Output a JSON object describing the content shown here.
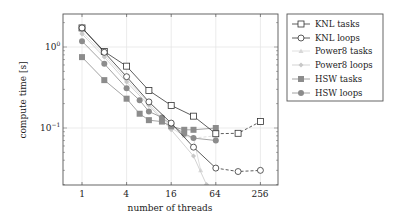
{
  "chart_data": {
    "type": "line",
    "title": "",
    "xlabel": "number of threads",
    "ylabel": "compute time [s]",
    "xscale": "log2",
    "yscale": "log10",
    "xlim": [
      0.56,
      430
    ],
    "ylim": [
      0.02,
      2.55
    ],
    "xticks": [
      1,
      4,
      16,
      64,
      256
    ],
    "xtick_labels": [
      "1",
      "4",
      "16",
      "64",
      "256"
    ],
    "yticks": [
      0.1,
      1
    ],
    "ytick_labels": [
      "10^-1",
      "10^0"
    ],
    "grid": true,
    "legend_position": "outside right, top",
    "series": [
      {
        "name": "KNL tasks",
        "marker": "square-open",
        "color": "#333333",
        "points": [
          [
            1,
            1.72
          ],
          [
            2,
            0.88
          ],
          [
            4,
            0.58
          ],
          [
            8,
            0.29
          ],
          [
            16,
            0.19
          ],
          [
            32,
            0.14
          ],
          [
            64,
            0.085
          ]
        ],
        "dashed_tail": [
          [
            64,
            0.085
          ],
          [
            128,
            0.086
          ],
          [
            256,
            0.12
          ]
        ]
      },
      {
        "name": "KNL loops",
        "marker": "circle-open",
        "color": "#333333",
        "points": [
          [
            1,
            1.72
          ],
          [
            2,
            0.86
          ],
          [
            4,
            0.43
          ],
          [
            8,
            0.21
          ],
          [
            16,
            0.115
          ],
          [
            32,
            0.058
          ],
          [
            64,
            0.032
          ]
        ],
        "dashed_tail": [
          [
            64,
            0.032
          ],
          [
            128,
            0.029
          ],
          [
            256,
            0.03
          ]
        ]
      },
      {
        "name": "Power8 tasks",
        "marker": "triangle",
        "color": "#d8d8d8",
        "points": [
          [
            1,
            1.55
          ],
          [
            2,
            0.8
          ],
          [
            4,
            0.4
          ],
          [
            8,
            0.2
          ],
          [
            16,
            0.1
          ],
          [
            24,
            0.08
          ],
          [
            32,
            0.075
          ],
          [
            40,
            0.03
          ]
        ],
        "dashed_tail": [
          [
            32,
            0.075
          ],
          [
            64,
            0.08
          ]
        ]
      },
      {
        "name": "Power8 loops",
        "marker": "diamond",
        "color": "#c8c8c8",
        "points": [
          [
            1,
            1.45
          ],
          [
            2,
            0.75
          ],
          [
            4,
            0.37
          ],
          [
            8,
            0.19
          ],
          [
            16,
            0.095
          ],
          [
            32,
            0.045
          ],
          [
            48,
            0.02
          ]
        ],
        "dashed_tail": []
      },
      {
        "name": "HSW tasks",
        "marker": "square-filled",
        "color": "#8c8c8c",
        "points": [
          [
            1,
            0.75
          ],
          [
            2,
            0.39
          ],
          [
            4,
            0.23
          ],
          [
            6,
            0.15
          ],
          [
            8,
            0.125
          ],
          [
            12,
            0.12
          ],
          [
            16,
            0.105
          ],
          [
            24,
            0.095
          ],
          [
            32,
            0.095
          ],
          [
            64,
            0.1
          ]
        ],
        "dashed_tail": []
      },
      {
        "name": "HSW loops",
        "marker": "circle-filled",
        "color": "#8c8c8c",
        "points": [
          [
            1,
            1.18
          ],
          [
            2,
            0.62
          ],
          [
            4,
            0.31
          ],
          [
            6,
            0.22
          ],
          [
            8,
            0.16
          ],
          [
            12,
            0.135
          ],
          [
            16,
            0.11
          ],
          [
            24,
            0.085
          ],
          [
            32,
            0.075
          ],
          [
            64,
            0.07
          ]
        ],
        "dashed_tail": []
      }
    ]
  },
  "axes": {
    "xlabel": "number of threads",
    "ylabel": "compute time [s]",
    "xtick_labels": [
      "1",
      "4",
      "16",
      "64",
      "256"
    ],
    "ytick_top": "10",
    "ytick_top_exp": "0",
    "ytick_bottom": "10",
    "ytick_bottom_exp": "−1"
  },
  "legend": {
    "items": [
      {
        "label": "KNL tasks"
      },
      {
        "label": "KNL loops"
      },
      {
        "label": "Power8 tasks"
      },
      {
        "label": "Power8 loops"
      },
      {
        "label": "HSW tasks"
      },
      {
        "label": "HSW loops"
      }
    ]
  }
}
